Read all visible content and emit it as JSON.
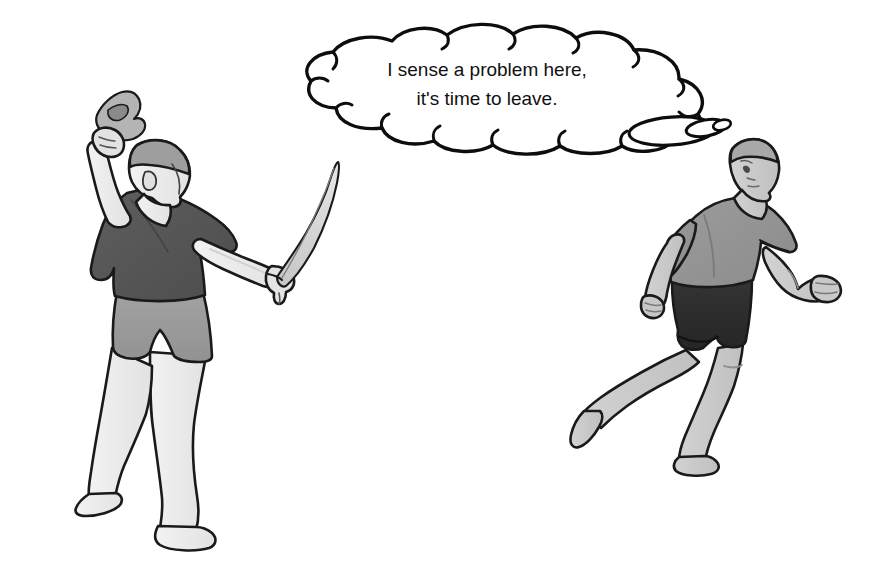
{
  "scene": {
    "title": "Cartoon: machete attacker and fleeing man",
    "background_color": "#ffffff",
    "width": 878,
    "height": 570
  },
  "thought_bubble": {
    "owner": "right-figure",
    "line1": "I sense a problem here,",
    "line2": "it's time to leave.",
    "outline_color": "#0d0d0d",
    "fill_color": "#ffffff",
    "tail_style": "three-shrinking-ellipses",
    "tail_direction": "toward-right-figure-head"
  },
  "figures": [
    {
      "id": "left-figure",
      "role": "attacker",
      "facing": "away-from-viewer-turned-right",
      "shirt_label": "dark gray t-shirt",
      "shirt_color": "#555555",
      "shorts_label": "medium gray shorts",
      "shorts_color": "#9a9a9a",
      "skin_color": "#ececec",
      "hair_color": "#9e9e9e",
      "outline_color": "#1a1a1a",
      "feet": "barefoot",
      "items": [
        {
          "name": "hatchet",
          "hand": "raised-left-hand",
          "color": "#b0b0b0"
        },
        {
          "name": "machete",
          "hand": "extended-right-hand",
          "color": "#d8d8d8"
        }
      ]
    },
    {
      "id": "right-figure",
      "role": "fleeing-man",
      "facing": "running-left-looking-back",
      "shirt_label": "medium gray t-shirt",
      "shirt_color": "#949494",
      "shorts_label": "near-black shorts",
      "shorts_color": "#2d2d2d",
      "skin_color": "#c9c9c9",
      "hair_color": "#a8a8a8",
      "outline_color": "#1a1a1a",
      "feet": "barefoot",
      "items": []
    }
  ],
  "palette": {
    "ink": "#1a1a1a",
    "bubble_ink": "#0d0d0d",
    "paper": "#ffffff",
    "dark_gray": "#555555",
    "mid_gray": "#949494",
    "light_gray": "#ececec",
    "near_black": "#2d2d2d"
  }
}
